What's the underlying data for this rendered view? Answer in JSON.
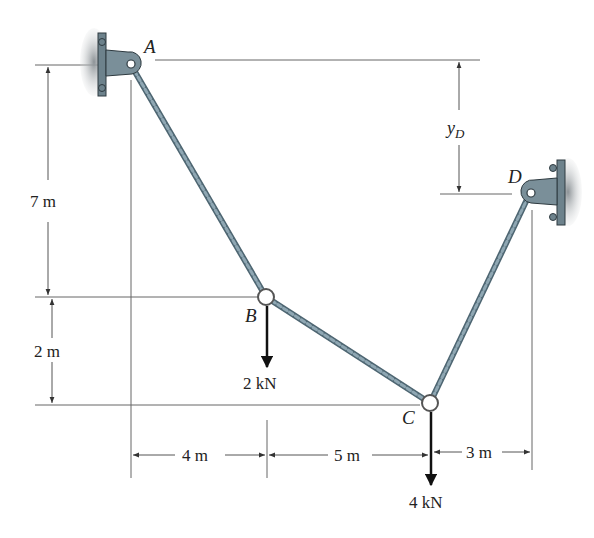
{
  "points": {
    "A": "A",
    "B": "B",
    "C": "C",
    "D": "D"
  },
  "dimensions": {
    "vertical_AB": "7 m",
    "vertical_BC": "2 m",
    "horizontal_AB": "4 m",
    "horizontal_BC": "5 m",
    "horizontal_CD": "3 m",
    "yD": "y",
    "yD_sub": "D"
  },
  "loads": {
    "B": "2 kN",
    "C": "4 kN"
  },
  "colors": {
    "cable": "#7f97a4",
    "cable_dark": "#4e6672",
    "support": "#6d828c",
    "shadow": "#9aa0a3",
    "line": "#555555"
  }
}
